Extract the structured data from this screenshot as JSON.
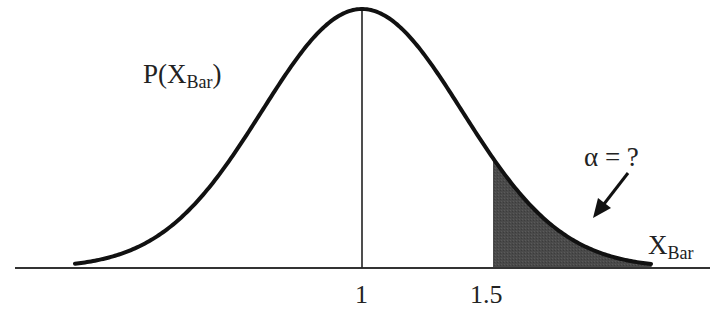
{
  "chart_data": {
    "type": "area",
    "title": "",
    "ylabel": "P(X_Bar)",
    "xlabel": "X_Bar",
    "x_ticks": [
      {
        "label": "1",
        "value": 1
      },
      {
        "label": "1.5",
        "value": 1.5
      }
    ],
    "mean": 1,
    "critical_value": 1.5,
    "shaded_region": "right tail, x >= 1.5",
    "annotation": "α = ?",
    "grid": false,
    "legend": null
  },
  "labels": {
    "y_label_main": "P(X",
    "y_label_sub": "Bar",
    "y_label_close": ")",
    "x_label_main": "X",
    "x_label_sub": "Bar",
    "tick_mean": "1",
    "tick_crit": "1.5",
    "alpha": "α = ?"
  },
  "colors": {
    "curve": "#111111",
    "shade": "#4a4a4a",
    "axis": "#333333"
  }
}
